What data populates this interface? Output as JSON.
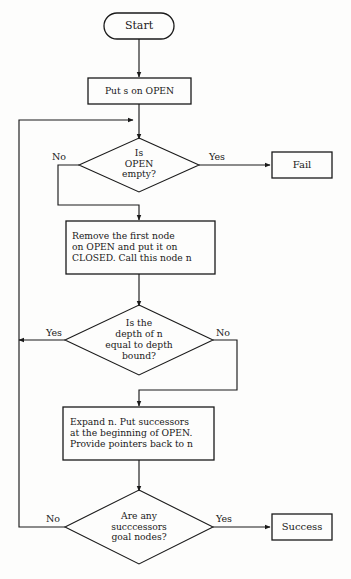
{
  "diagram": {
    "type": "flowchart",
    "stroke_color": "#1a1a1a",
    "background_color": "#fdfdfc",
    "nodes": {
      "start": {
        "label": "Start",
        "shape": "terminator-oval"
      },
      "put_s_on_open": {
        "label": "Put s on OPEN",
        "shape": "process-rectangle"
      },
      "is_open_empty": {
        "label": "Is\nOPEN\nempty?",
        "shape": "decision-diamond"
      },
      "fail": {
        "label": "Fail",
        "shape": "terminal-rectangle"
      },
      "remove_first_node": {
        "label": "Remove the first node\non OPEN and put it on\nCLOSED. Call this node n",
        "shape": "process-rectangle"
      },
      "depth_check": {
        "label": "Is the\ndepth of n\nequal to depth\nbound?",
        "shape": "decision-diamond"
      },
      "expand_n": {
        "label": "Expand n. Put successors\nat the beginning of OPEN.\nProvide pointers back to n",
        "shape": "process-rectangle"
      },
      "goal_check": {
        "label": "Are any\nsucccessors\ngoal nodes?",
        "shape": "decision-diamond"
      },
      "success": {
        "label": "Success",
        "shape": "terminal-rectangle"
      }
    },
    "edge_labels": {
      "open_empty_no": "No",
      "open_empty_yes": "Yes",
      "depth_yes": "Yes",
      "depth_no": "No",
      "goal_no": "No",
      "goal_yes": "Yes"
    }
  }
}
